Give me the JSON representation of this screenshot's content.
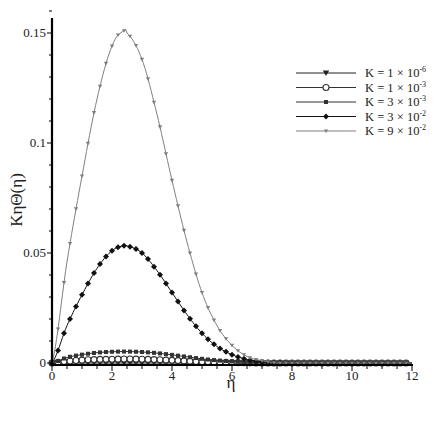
{
  "chart_data": {
    "type": "line",
    "title": "",
    "xlabel": "η",
    "ylabel": "KηΘ(η)",
    "xlim": [
      0,
      12
    ],
    "ylim": [
      0,
      0.16
    ],
    "xticks": [
      0,
      2,
      4,
      6,
      8,
      10,
      12
    ],
    "xtick_labels": [
      "0",
      "2",
      "4",
      "6",
      "8",
      "10",
      "12"
    ],
    "yticks": [
      0,
      0.05,
      0.1,
      0.15
    ],
    "ytick_labels": [
      "0",
      "0.05",
      "0.1",
      "0.15"
    ],
    "grid": false,
    "legend_position": "upper right",
    "x": [
      0,
      0.5,
      1,
      1.5,
      2,
      2.4,
      2.5,
      3,
      3.5,
      4,
      4.5,
      5,
      5.5,
      6,
      6.5,
      7,
      7.5,
      8,
      9,
      10,
      11,
      12
    ],
    "series": [
      {
        "name": "K = 1 × 10⁻⁶",
        "marker": "triangle-down",
        "color": "#222222",
        "values": [
          0,
          0,
          0,
          0,
          0,
          0,
          0,
          0,
          0,
          0,
          0,
          0,
          0,
          0,
          0,
          0,
          0,
          0,
          0,
          0,
          0,
          0
        ]
      },
      {
        "name": "K = 1 × 10⁻³",
        "marker": "circle-open",
        "color": "#333333",
        "values": [
          0,
          0.0008,
          0.0013,
          0.0016,
          0.0017,
          0.0018,
          0.0018,
          0.0017,
          0.0015,
          0.0012,
          0.0009,
          0.0006,
          0.0004,
          0.0002,
          0.0001,
          0,
          0,
          0,
          0,
          0,
          0,
          0
        ]
      },
      {
        "name": "K = 3 × 10⁻³",
        "marker": "square",
        "color": "#333333",
        "values": [
          0,
          0.0025,
          0.0038,
          0.0047,
          0.0051,
          0.0052,
          0.0052,
          0.005,
          0.0045,
          0.0037,
          0.0028,
          0.0019,
          0.0012,
          0.0007,
          0.0003,
          0.0001,
          0,
          0,
          0,
          0,
          0,
          0
        ]
      },
      {
        "name": "K = 3 × 10⁻²",
        "marker": "diamond",
        "color": "#111111",
        "values": [
          0,
          0.017,
          0.031,
          0.043,
          0.051,
          0.0533,
          0.0532,
          0.05,
          0.042,
          0.032,
          0.022,
          0.0135,
          0.0075,
          0.0038,
          0.0016,
          0.0005,
          0.0001,
          0,
          0,
          0,
          0,
          0
        ]
      },
      {
        "name": "K = 9 × 10⁻²",
        "marker": "tri-small",
        "color": "#808080",
        "values": [
          0,
          0.046,
          0.085,
          0.12,
          0.144,
          0.151,
          0.15,
          0.138,
          0.113,
          0.083,
          0.055,
          0.032,
          0.017,
          0.008,
          0.003,
          0.001,
          0,
          0,
          0,
          0,
          0,
          0
        ]
      }
    ]
  },
  "legend": {
    "items": [
      "K = 1 × 10",
      "K = 1 × 10",
      "K = 3 × 10",
      "K = 3 × 10",
      "K = 9 × 10"
    ],
    "exponents": [
      "-6",
      "-3",
      "-3",
      "-2",
      "-2"
    ]
  },
  "axes": {
    "xlabel": "η",
    "ylabel": "KηΘ(η)"
  }
}
